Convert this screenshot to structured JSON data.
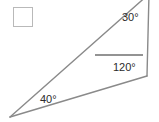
{
  "figure": {
    "type": "triangle-angles-diagram",
    "stroke_color": "#8a8a8a",
    "text_color": "#2b2b2b",
    "checkbox_border_color": "#b9b9b9",
    "background": "#ffffff",
    "vertices": {
      "left": [
        10,
        117
      ],
      "top": [
        149,
        -4
      ],
      "bottom_right": [
        147,
        76
      ]
    },
    "tick_mark": {
      "x1": 95,
      "y1": 55,
      "x2": 143,
      "y2": 55
    },
    "angles": {
      "top": "30°",
      "bottom_right": "120°",
      "left": "40°"
    }
  },
  "checkbox": {
    "checked": false,
    "label": ""
  }
}
